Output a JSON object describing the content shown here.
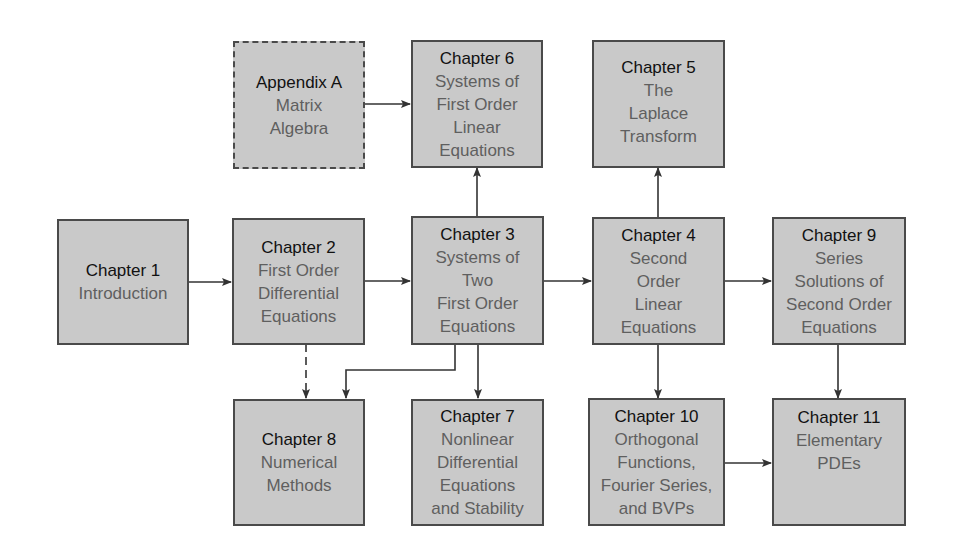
{
  "diagram": {
    "colors": {
      "box_fill": "#c9c9c9",
      "box_border": "#4a4a4a",
      "heading_text": "#111111",
      "subtitle_text": "#5f5f5f",
      "arrow": "#333333"
    },
    "nodes": {
      "appendix_a": {
        "heading": "Appendix A",
        "lines": [
          "Matrix",
          "Algebra"
        ],
        "style": "dashed"
      },
      "ch1": {
        "heading": "Chapter 1",
        "lines": [
          "Introduction"
        ]
      },
      "ch2": {
        "heading": "Chapter 2",
        "lines": [
          "First Order",
          "Differential",
          "Equations"
        ]
      },
      "ch3": {
        "heading": "Chapter 3",
        "lines": [
          "Systems of",
          "Two",
          "First Order",
          "Equations"
        ]
      },
      "ch4": {
        "heading": "Chapter 4",
        "lines": [
          "Second",
          "Order",
          "Linear",
          "Equations"
        ]
      },
      "ch5": {
        "heading": "Chapter 5",
        "lines": [
          "The",
          "Laplace",
          "Transform"
        ]
      },
      "ch6": {
        "heading": "Chapter 6",
        "lines": [
          "Systems of",
          "First Order",
          "Linear",
          "Equations"
        ]
      },
      "ch7": {
        "heading": "Chapter 7",
        "lines": [
          "Nonlinear",
          "Differential",
          "Equations",
          "and Stability"
        ]
      },
      "ch8": {
        "heading": "Chapter 8",
        "lines": [
          "Numerical",
          "Methods"
        ]
      },
      "ch9": {
        "heading": "Chapter 9",
        "lines": [
          "Series",
          "Solutions of",
          "Second Order",
          "Equations"
        ]
      },
      "ch10": {
        "heading": "Chapter 10",
        "lines": [
          "Orthogonal",
          "Functions,",
          "Fourier Series,",
          "and BVPs"
        ]
      },
      "ch11": {
        "heading": "Chapter 11",
        "lines": [
          "Elementary",
          "PDEs"
        ]
      }
    },
    "edges": [
      {
        "from": "appendix_a",
        "to": "ch6",
        "style": "solid"
      },
      {
        "from": "ch1",
        "to": "ch2",
        "style": "solid"
      },
      {
        "from": "ch2",
        "to": "ch3",
        "style": "solid"
      },
      {
        "from": "ch3",
        "to": "ch4",
        "style": "solid"
      },
      {
        "from": "ch4",
        "to": "ch9",
        "style": "solid"
      },
      {
        "from": "ch3",
        "to": "ch6",
        "style": "solid"
      },
      {
        "from": "ch4",
        "to": "ch5",
        "style": "solid"
      },
      {
        "from": "ch2",
        "to": "ch8",
        "style": "dashed"
      },
      {
        "from": "ch3",
        "to": "ch8",
        "style": "solid"
      },
      {
        "from": "ch3",
        "to": "ch7",
        "style": "solid"
      },
      {
        "from": "ch4",
        "to": "ch10",
        "style": "solid"
      },
      {
        "from": "ch9",
        "to": "ch11",
        "style": "solid"
      },
      {
        "from": "ch10",
        "to": "ch11",
        "style": "solid"
      }
    ]
  }
}
